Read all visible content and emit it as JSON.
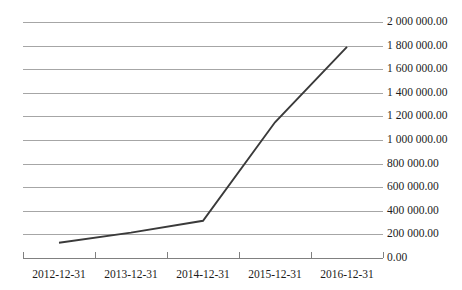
{
  "chart_data": {
    "type": "line",
    "title": "",
    "subtitle": "",
    "xlabel": "",
    "ylabel": "",
    "categories": [
      "2012-12-31",
      "2013-12-31",
      "2014-12-31",
      "2015-12-31",
      "2016-12-31"
    ],
    "series": [
      {
        "name": "",
        "values": [
          130000,
          215000,
          315000,
          1150000,
          1790000
        ]
      }
    ],
    "ylim": [
      0,
      2000000
    ],
    "ytick_values": [
      2000000,
      1800000,
      1600000,
      1400000,
      1200000,
      1000000,
      800000,
      600000,
      400000,
      200000,
      0
    ],
    "ytick_labels": [
      "2 000 000.00",
      "1 800 000.00",
      "1 600 000.00",
      "1 400 000.00",
      "1 200 000.00",
      "1 000 000.00",
      "800 000.00",
      "600 000.00",
      "400 000.00",
      "200 000.00",
      "0.00"
    ],
    "grid": true,
    "grid_axis": "y",
    "legend": false,
    "legend_position": "none",
    "colors": {
      "series_line": "#3a3a3a",
      "gridline": "#a6a6a6",
      "axis": "#808080",
      "text": "#1c1c1c",
      "background": "#ffffff"
    }
  }
}
